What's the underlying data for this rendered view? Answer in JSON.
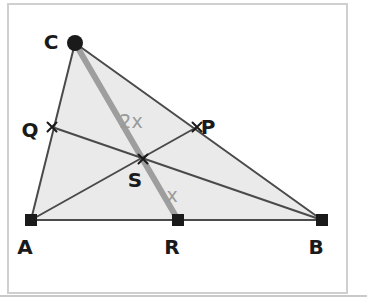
{
  "figure": {
    "canvas": {
      "width": 367,
      "height": 303
    },
    "background_color": "#ffffff",
    "frame": {
      "color": "#cfcfcf",
      "x": 8,
      "y": 4,
      "width": 339,
      "height": 289
    },
    "baseline_rule": {
      "color": "#c9c9c9",
      "y": 296,
      "x1": 0,
      "x2": 367
    }
  },
  "style": {
    "triangle_fill": "#eaeaea",
    "line_color": "#4a4a4a",
    "thick_line_color": "#9e9e9e",
    "marker_color": "#1a1a1a",
    "label_color": "#1a1a1a",
    "angle_label_color": "#9a9a9a",
    "line_width": 2,
    "thick_line_width": 6
  },
  "points": [
    {
      "id": "A",
      "label": "A",
      "x": 31,
      "y": 220,
      "marker": "square-marker",
      "label_dx": -6,
      "label_dy": 28
    },
    {
      "id": "B",
      "label": "B",
      "x": 322,
      "y": 220,
      "marker": "square-marker",
      "label_dx": -6,
      "label_dy": 28
    },
    {
      "id": "C",
      "label": "C",
      "x": 75,
      "y": 43,
      "marker": "circle-marker",
      "label_dx": -24,
      "label_dy": 0
    },
    {
      "id": "P",
      "label": "P",
      "x": 197,
      "y": 127,
      "marker": "cross-marker",
      "label_dx": 11,
      "label_dy": 1
    },
    {
      "id": "Q",
      "label": "Q",
      "x": 52,
      "y": 127,
      "marker": "cross-marker",
      "label_dx": -22,
      "label_dy": 4
    },
    {
      "id": "R",
      "label": "R",
      "x": 178,
      "y": 220,
      "marker": "square-marker",
      "label_dx": -6,
      "label_dy": 28
    },
    {
      "id": "S",
      "label": "S",
      "x": 143,
      "y": 159,
      "marker": "cross-marker",
      "label_dx": -8,
      "label_dy": 22
    }
  ],
  "triangle": {
    "name": "triangle-ABC",
    "vertices": [
      "A",
      "B",
      "C"
    ],
    "polygon": "31,220 322,220 75,43"
  },
  "segments": [
    {
      "id": "AB",
      "name": "segment-AB",
      "from": "A",
      "to": "B",
      "style": "thin"
    },
    {
      "id": "AC",
      "name": "segment-AC",
      "from": "A",
      "to": "C",
      "style": "thin"
    },
    {
      "id": "CB",
      "name": "segment-CB",
      "from": "C",
      "to": "B",
      "style": "thin"
    },
    {
      "id": "AP",
      "name": "cevian-AP",
      "from": "A",
      "to": "P",
      "style": "thin"
    },
    {
      "id": "QB",
      "name": "cevian-QB",
      "from": "Q",
      "to": "B",
      "style": "thin"
    },
    {
      "id": "CR",
      "name": "cevian-CR",
      "from": "C",
      "to": "R",
      "style": "thick"
    }
  ],
  "angle_labels": [
    {
      "id": "angle-2x",
      "text": "2x",
      "x": 131,
      "y": 122,
      "name": "angle-label-2x"
    },
    {
      "id": "angle-x",
      "text": "x",
      "x": 172,
      "y": 196,
      "name": "angle-label-x"
    }
  ],
  "markers": {
    "square-marker": {
      "size": 12,
      "shape": "filled-square"
    },
    "circle-marker": {
      "radius": 8,
      "shape": "filled-circle"
    },
    "cross-marker": {
      "size": 9,
      "shape": "x-cross"
    }
  }
}
